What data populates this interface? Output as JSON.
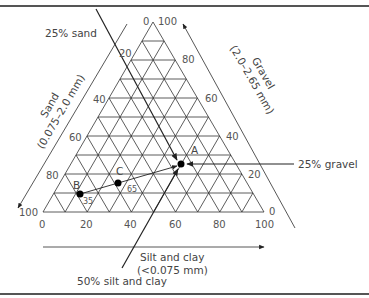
{
  "axes": {
    "sand": {
      "label": "Sand",
      "range": "(0.075–2.0 mm)",
      "ticks": [
        "20",
        "40",
        "60",
        "80",
        "100"
      ]
    },
    "gravel": {
      "label": "Gravel",
      "range": "(2.0–2.65 mm)",
      "ticks": [
        "100",
        "80",
        "60",
        "40",
        "20",
        "0"
      ]
    },
    "silt_clay": {
      "label": "Silt and clay",
      "range": "(<0.075 mm)",
      "ticks": [
        "0",
        "20",
        "40",
        "60",
        "80",
        "100"
      ]
    },
    "apex_zero": "0"
  },
  "annotations": {
    "sand_line": "25% sand",
    "gravel_line": "25% gravel",
    "silt_line": "50% silt and clay"
  },
  "points": [
    {
      "label": "A",
      "note": ""
    },
    {
      "label": "B",
      "note": "35"
    },
    {
      "label": "C",
      "note": "65"
    }
  ],
  "colors": {
    "line": "#333333",
    "text": "#444444",
    "point": "#000000"
  },
  "chart_data": {
    "type": "ternary",
    "title": "",
    "axes": [
      "Sand (0.075–2.0 mm)",
      "Gravel (2.0–2.65 mm)",
      "Silt and clay (<0.075 mm)"
    ],
    "tick_step": 10,
    "tick_labels": [
      0,
      20,
      40,
      60,
      80,
      100
    ],
    "points": [
      {
        "label": "A",
        "sand": 25,
        "gravel": 25,
        "silt_clay": 50
      },
      {
        "label": "B",
        "sand": 80,
        "gravel": 5,
        "silt_clay": 15
      },
      {
        "label": "C",
        "sand": 60,
        "gravel": 10,
        "silt_clay": 30
      }
    ],
    "tie_line": {
      "from": "B",
      "to": "A",
      "through": "C",
      "segment_labels": [
        "35",
        "65"
      ]
    },
    "guides": [
      "25% sand",
      "25% gravel",
      "50% silt and clay"
    ]
  }
}
